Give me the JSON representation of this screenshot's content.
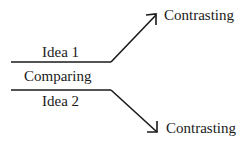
{
  "diagram": {
    "top_branch_label": "Idea 1",
    "center_label": "Comparing",
    "bottom_branch_label": "Idea 2",
    "top_arrow_label": "Contrasting",
    "bottom_arrow_label": "Contrasting",
    "line_color": "#1a1a1a"
  }
}
